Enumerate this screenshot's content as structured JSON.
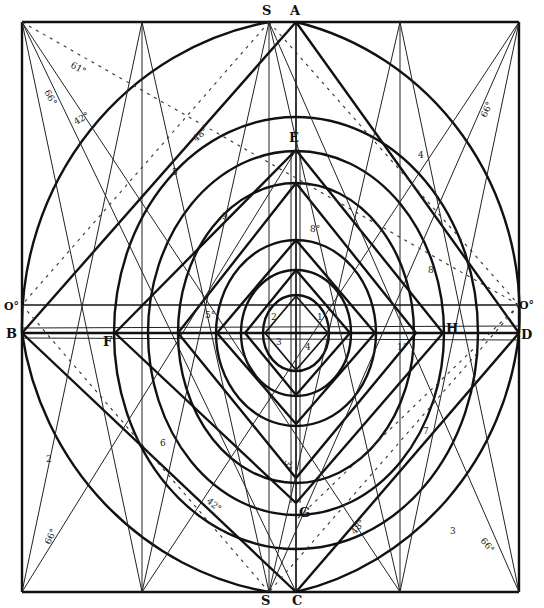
{
  "figure": {
    "type": "geometric construction diagram"
  },
  "points": {
    "S_top": "S",
    "A": "A",
    "E": "E",
    "B": "B",
    "F": "F",
    "H": "H",
    "D": "D",
    "G": "G",
    "S_bottom": "S",
    "C": "C",
    "O_left": "O°",
    "O_right": "O°"
  },
  "angle_labels": {
    "top_left_dashed": "61°",
    "top_left_steep": "66°",
    "top_left_mid": "42°",
    "upper_left_inner": "48°",
    "top_right": "66°",
    "inner_top": "8°",
    "left_center": "5°",
    "right_center": "1°",
    "bottom_center": "3°",
    "lower_left_inner": "42°",
    "lower_left": "66°",
    "lower_right_inner": "48°",
    "lower_right": "66°"
  },
  "number_labels": {
    "n1": "1",
    "n2": "2",
    "n3": "3",
    "n4": "4",
    "n5": "5",
    "n6": "6",
    "n7": "7",
    "n8": "8",
    "n9": "9",
    "c1": "1",
    "c2": "2",
    "c3": "3",
    "c4": "4",
    "c5": "5"
  },
  "colors": {
    "ink": "#111111",
    "paper": "#ffffff"
  }
}
